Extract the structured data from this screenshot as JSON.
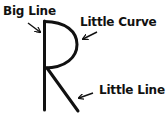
{
  "diagram": {
    "letter": "R",
    "labels": {
      "big_line": "Big Line",
      "little_curve": "Little Curve",
      "little_line": "Little Line"
    },
    "colors": {
      "stroke": "#111111",
      "background": "#ffffff"
    }
  }
}
